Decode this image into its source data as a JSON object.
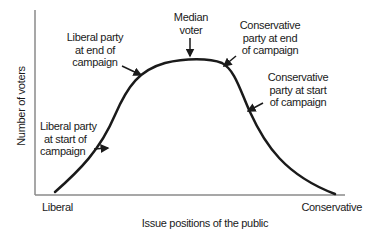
{
  "diagram": {
    "y_axis_label": "Number of voters",
    "x_axis_label": "Issue positions of the public",
    "x_left_label": "Liberal",
    "x_right_label": "Conservative",
    "annotations": {
      "median_voter": [
        "Median",
        "voter"
      ],
      "liberal_end": [
        "Liberal party",
        "at end of",
        "campaign"
      ],
      "liberal_start": [
        "Liberal party",
        "at start of",
        "campaign"
      ],
      "conservative_end": [
        "Conservative",
        "party at end",
        "of campaign"
      ],
      "conservative_start": [
        "Conservative",
        "party at start",
        "of campaign"
      ]
    },
    "colors": {
      "curve": "#1a1a1a",
      "axis": "#8a8a8a",
      "text": "#1a1a1a"
    }
  }
}
